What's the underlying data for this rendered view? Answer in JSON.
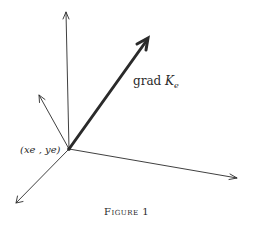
{
  "figure": {
    "caption": "Figure 1",
    "grad_label": {
      "prefix": "grad ",
      "symbol": "K",
      "subscript": "e"
    },
    "point_label": "(xe , ye)",
    "colors": {
      "ink": "#2a2a2a",
      "background": "#ffffff"
    },
    "vectors": [
      {
        "name": "vertical-up",
        "from": [
          69,
          149
        ],
        "to": [
          66,
          12
        ],
        "weight": "thin"
      },
      {
        "name": "grad-K",
        "from": [
          69,
          149
        ],
        "to": [
          148,
          38
        ],
        "weight": "thick"
      },
      {
        "name": "up-left",
        "from": [
          69,
          149
        ],
        "to": [
          39,
          95
        ],
        "weight": "thin"
      },
      {
        "name": "right",
        "from": [
          69,
          149
        ],
        "to": [
          237,
          178
        ],
        "weight": "thin"
      },
      {
        "name": "down-left",
        "from": [
          69,
          149
        ],
        "to": [
          16,
          203
        ],
        "weight": "thin"
      }
    ]
  }
}
